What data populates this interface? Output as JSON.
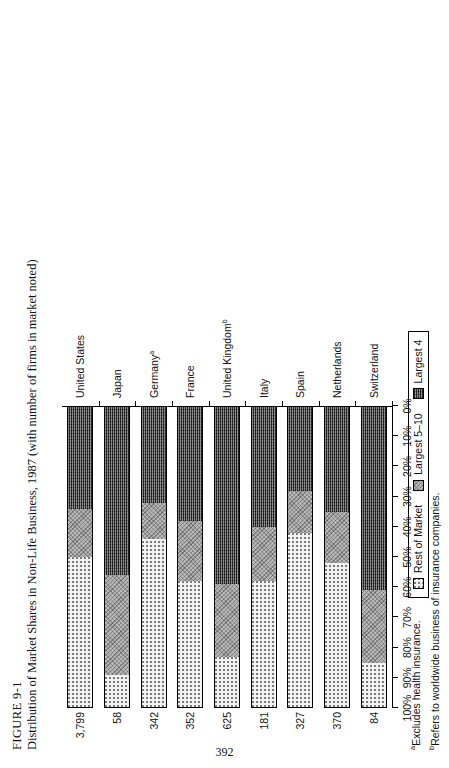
{
  "figure": {
    "number": "FIGURE 9-1",
    "caption": "Distribution of Market Shares in Non-Life Business, 1987 (with number of firms in market noted)"
  },
  "page_number": "392",
  "footnotes": [
    {
      "marker": "a",
      "text": "Excludes health insurance."
    },
    {
      "marker": "b",
      "text": "Refers to worldwide business of insurance companies."
    }
  ],
  "legend": {
    "items": [
      {
        "label": "Rest of Market",
        "swatch": "dotted-light",
        "color": "#f2f2f2"
      },
      {
        "label": "Largest 5–10",
        "swatch": "cross-hatch-gray",
        "color": "#b9b9b9"
      },
      {
        "label": "Largest 4",
        "swatch": "dense-dark",
        "color": "#4a4a4a"
      }
    ]
  },
  "chart_data": {
    "type": "bar",
    "orientation": "horizontal-stacked",
    "title": "Distribution of Market Shares in Non-Life Business, 1987 (with number of firms in market noted)",
    "xlabel": "",
    "ylabel": "",
    "xlim": [
      0,
      100
    ],
    "grid": false,
    "legend_position": "bottom-center",
    "tick_labels": [
      "100%",
      "90%",
      "80%",
      "70%",
      "60%",
      "50%",
      "40%",
      "30%",
      "20%",
      "10%",
      "0%"
    ],
    "tick_values": [
      100,
      90,
      80,
      70,
      60,
      50,
      40,
      30,
      20,
      10,
      0
    ],
    "categories": [
      "United States",
      "Japan",
      "Germany",
      "France",
      "United Kingdom",
      "Italy",
      "Spain",
      "Netherlands",
      "Switzerland"
    ],
    "category_footnote_markers": [
      "",
      "",
      "a",
      "",
      "b",
      "",
      "",
      "",
      ""
    ],
    "point_labels_name": "number of firms in market",
    "point_labels": [
      "3,799",
      "58",
      "342",
      "352",
      "625",
      "181",
      "327",
      "370",
      "84"
    ],
    "series": [
      {
        "name": "Largest 4",
        "values": [
          34,
          56,
          32,
          38,
          59,
          40,
          28,
          35,
          61
        ]
      },
      {
        "name": "Largest 5–10",
        "values": [
          16,
          33,
          12,
          20,
          24,
          18,
          14,
          17,
          24
        ]
      },
      {
        "name": "Rest of Market",
        "values": [
          50,
          11,
          56,
          42,
          17,
          42,
          58,
          48,
          15
        ]
      }
    ]
  }
}
